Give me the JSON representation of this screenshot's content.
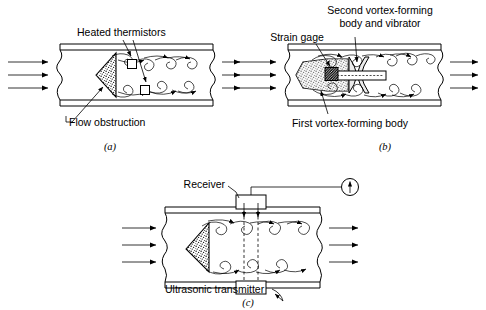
{
  "figure": {
    "background_color": "#ffffff",
    "ink_color": "#000000",
    "shading_color": "#e8e8e8"
  },
  "panels": [
    {
      "id": "a",
      "panel_label": "(a)",
      "method": "thermal",
      "labels": [
        {
          "name": "heated-thermistors",
          "text": "Heated thermistors"
        },
        {
          "name": "flow-obstruction",
          "text": "Flow obstruction"
        }
      ],
      "elements": {
        "obstruction_shape": "triangle",
        "sensor_count": 2,
        "sensor_shape": "square",
        "inlet_arrows": 3,
        "outlet_arrows": 3,
        "vortex_rows": 2
      }
    },
    {
      "id": "b",
      "panel_label": "(b)",
      "method": "strain-gage",
      "labels": [
        {
          "name": "strain-gage",
          "text": "Strain gage"
        },
        {
          "name": "second-vortex-forming-body",
          "text": "Second vortex-forming"
        },
        {
          "name": "second-vortex-forming-body-line2",
          "text": "body and vibrator"
        },
        {
          "name": "first-vortex-forming-body",
          "text": "First vortex-forming body"
        }
      ],
      "elements": {
        "obstruction_shape": "bluff-body",
        "sensor_shape": "hatched-block",
        "inlet_arrows": 3,
        "outlet_arrows": 3,
        "vortex_rows": 2
      }
    },
    {
      "id": "c",
      "panel_label": "(c)",
      "method": "ultrasonic",
      "labels": [
        {
          "name": "receiver",
          "text": "Receiver"
        },
        {
          "name": "ultrasonic-transmitter",
          "text": "Ultrasonic transmitter"
        }
      ],
      "elements": {
        "obstruction_shape": "triangle",
        "meter_symbol": "circle-with-arrow",
        "beam_style": "dashed",
        "beam_count": 2,
        "inlet_arrows": 3,
        "outlet_arrows": 3,
        "vortex_rows": 2
      }
    }
  ]
}
